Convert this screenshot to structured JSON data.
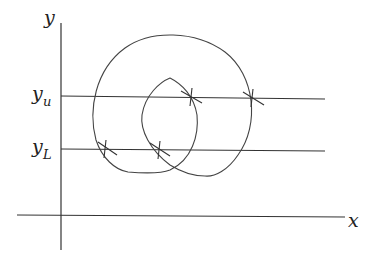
{
  "diagram": {
    "axes": {
      "x_label": "x",
      "y_label": "y"
    },
    "levels": [
      {
        "name": "upper",
        "label_main": "y",
        "label_sub": "u"
      },
      {
        "name": "lower",
        "label_main": "y",
        "label_sub": "L"
      }
    ],
    "intersection_marks": 4,
    "colors": {
      "stroke": "#333333",
      "background": "#ffffff"
    }
  }
}
